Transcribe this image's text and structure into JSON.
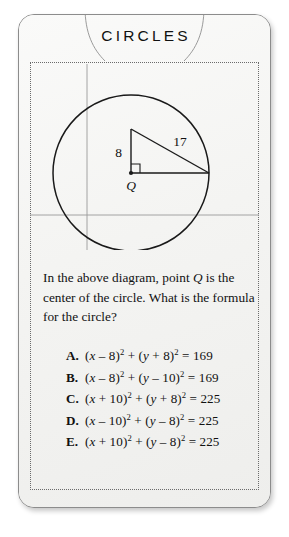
{
  "card": {
    "title": "CIRCLES"
  },
  "diagram": {
    "label_center": "Q",
    "label_leg": "8",
    "label_hypotenuse": "17",
    "icons": {
      "right_angle": "right-angle-marker",
      "center_point": "center-point-dot"
    }
  },
  "question": {
    "line1_a": "In the above diagram, point ",
    "line1_var": "Q",
    "line1_b": " is the center of the circle. What is the formula for the circle?"
  },
  "choices": [
    {
      "letter": "A.",
      "lhs_open": "(",
      "x_var": "x",
      "x_op": " – 8)",
      "x_exp": "2",
      "plus": " + (",
      "y_var": "y",
      "y_op": " + 8)",
      "y_exp": "2",
      "eq": " = 169"
    },
    {
      "letter": "B.",
      "lhs_open": "(",
      "x_var": "x",
      "x_op": " – 8)",
      "x_exp": "2",
      "plus": " + (",
      "y_var": "y",
      "y_op": " – 10)",
      "y_exp": "2",
      "eq": " = 169"
    },
    {
      "letter": "C.",
      "lhs_open": "(",
      "x_var": "x",
      "x_op": " + 10)",
      "x_exp": "2",
      "plus": " + (",
      "y_var": "y",
      "y_op": " + 8)",
      "y_exp": "2",
      "eq": " = 225"
    },
    {
      "letter": "D.",
      "lhs_open": "(",
      "x_var": "x",
      "x_op": " – 10)",
      "x_exp": "2",
      "plus": " + (",
      "y_var": "y",
      "y_op": " – 8)",
      "y_exp": "2",
      "eq": " = 225"
    },
    {
      "letter": "E.",
      "lhs_open": "(",
      "x_var": "x",
      "x_op": " + 10)",
      "x_exp": "2",
      "plus": " + (",
      "y_var": "y",
      "y_op": " – 8)",
      "y_exp": "2",
      "eq": " = 225"
    }
  ],
  "colors": {
    "ink": "#111111",
    "card_bg": "#f7f7f6",
    "card_border": "#8c8c8c",
    "dotted_border": "#6b6b6b",
    "axis": "#9a9a9a",
    "banner_arc": "#8f8f8f",
    "figure_stroke": "#1a1a1a"
  }
}
